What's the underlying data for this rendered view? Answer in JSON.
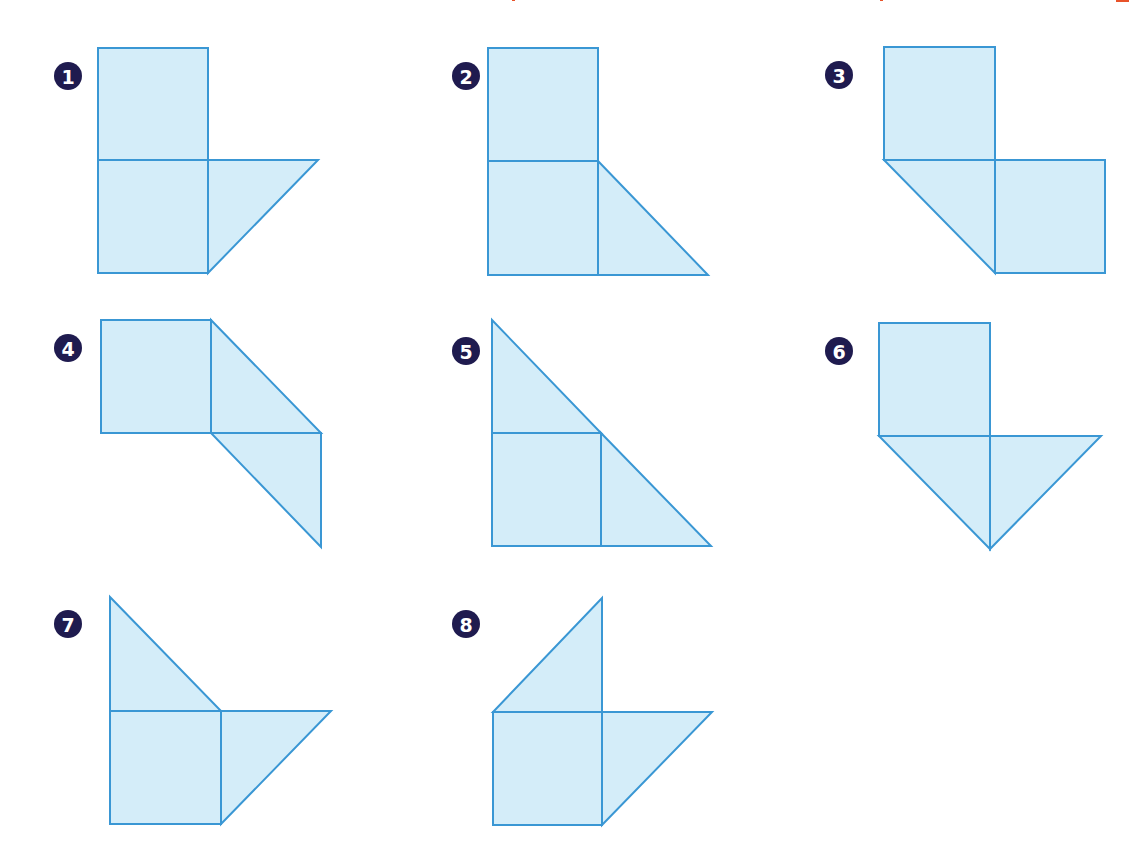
{
  "title_fragment_color": "#e8532a",
  "colors": {
    "fill": "#d4edf9",
    "stroke": "#3a97d4",
    "badge": "#1f1b4f",
    "badge_text": "#ffffff"
  },
  "figures": [
    {
      "number": "1",
      "badge": {
        "cx": 68,
        "cy": 76
      },
      "shapes": [
        {
          "type": "square",
          "points": "98,48 208,48 208,160 98,160"
        },
        {
          "type": "square",
          "points": "98,160 208,160 208,273 98,273"
        },
        {
          "type": "triangle",
          "points": "208,160 318,160 208,273"
        }
      ]
    },
    {
      "number": "2",
      "badge": {
        "cx": 466,
        "cy": 76
      },
      "shapes": [
        {
          "type": "square",
          "points": "488,48 598,48 598,161 488,161"
        },
        {
          "type": "square",
          "points": "488,161 598,161 598,275 488,275"
        },
        {
          "type": "triangle",
          "points": "598,161 708,275 598,275"
        }
      ]
    },
    {
      "number": "3",
      "badge": {
        "cx": 839,
        "cy": 75
      },
      "shapes": [
        {
          "type": "square",
          "points": "884,47 995,47 995,160 884,160"
        },
        {
          "type": "square",
          "points": "995,160 1105,160 1105,273 995,273"
        },
        {
          "type": "triangle",
          "points": "884,160 995,160 995,273"
        }
      ]
    },
    {
      "number": "4",
      "badge": {
        "cx": 68,
        "cy": 348
      },
      "shapes": [
        {
          "type": "square",
          "points": "101,320 211,320 211,433 101,433"
        },
        {
          "type": "triangle",
          "points": "211,320 321,433 211,433"
        },
        {
          "type": "triangle",
          "points": "211,433 321,433 321,547"
        }
      ]
    },
    {
      "number": "5",
      "badge": {
        "cx": 466,
        "cy": 351
      },
      "shapes": [
        {
          "type": "triangle",
          "points": "492,320 601,433 492,433"
        },
        {
          "type": "square",
          "points": "492,433 601,433 601,546 492,546"
        },
        {
          "type": "triangle",
          "points": "601,433 711,546 601,546"
        }
      ]
    },
    {
      "number": "6",
      "badge": {
        "cx": 839,
        "cy": 351
      },
      "shapes": [
        {
          "type": "square",
          "points": "879,323 990,323 990,436 879,436"
        },
        {
          "type": "triangle",
          "points": "879,436 990,436 990,549"
        },
        {
          "type": "triangle",
          "points": "990,436 1101,436 990,549"
        }
      ]
    },
    {
      "number": "7",
      "badge": {
        "cx": 68,
        "cy": 624
      },
      "shapes": [
        {
          "type": "triangle",
          "points": "110,597 221,711 110,711"
        },
        {
          "type": "square",
          "points": "110,711 221,711 221,824 110,824"
        },
        {
          "type": "triangle",
          "points": "221,711 331,711 221,824"
        }
      ]
    },
    {
      "number": "8",
      "badge": {
        "cx": 466,
        "cy": 624
      },
      "shapes": [
        {
          "type": "triangle",
          "points": "602,598 602,712 493,712"
        },
        {
          "type": "square",
          "points": "493,712 602,712 602,825 493,825"
        },
        {
          "type": "triangle",
          "points": "602,712 712,712 602,825"
        }
      ]
    }
  ]
}
